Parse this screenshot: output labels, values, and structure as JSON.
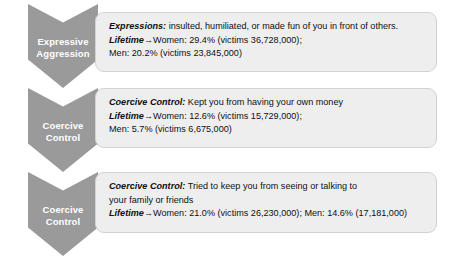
{
  "diagram": {
    "colors": {
      "chevron_fill": "#9a9a9a",
      "chevron_text": "#ffffff",
      "panel_fill": "#eeeeee",
      "panel_border": "#d2d2d2",
      "panel_text": "#101010",
      "page_background": "#ffffff"
    },
    "rows": [
      {
        "chevron_label": "Expressive\nAggression",
        "lines": [
          {
            "lead": "Expressions:",
            "rest": " insulted, humiliated, or made fun of you in front of others."
          },
          {
            "lead": "Lifetime",
            "arrow": "→",
            "rest": "Women: 29.4% (victims 36,728,000);"
          },
          {
            "lead": "",
            "rest": "Men: 20.2% (victims 23,845,000)"
          }
        ]
      },
      {
        "chevron_label": "Coercive\nControl",
        "lines": [
          {
            "lead": "Coercive Control:",
            "rest": " Kept you from having your own money"
          },
          {
            "lead": "Lifetime",
            "arrow": "→",
            "rest": "Women: 12.6% (victims 15,729,000);"
          },
          {
            "lead": "",
            "rest": "Men: 5.7% (victims 6,675,000)"
          }
        ]
      },
      {
        "chevron_label": "Coercive\nControl",
        "lines": [
          {
            "lead": "Coercive Control:",
            "rest": " Tried to keep you from seeing or talking to"
          },
          {
            "lead": "",
            "rest": "your family or friends"
          },
          {
            "lead": "Lifetime",
            "arrow": "→",
            "rest": "Women: 21.0% (victims 26,230,000); Men: 14.6% (17,181,000)"
          }
        ]
      }
    ]
  }
}
